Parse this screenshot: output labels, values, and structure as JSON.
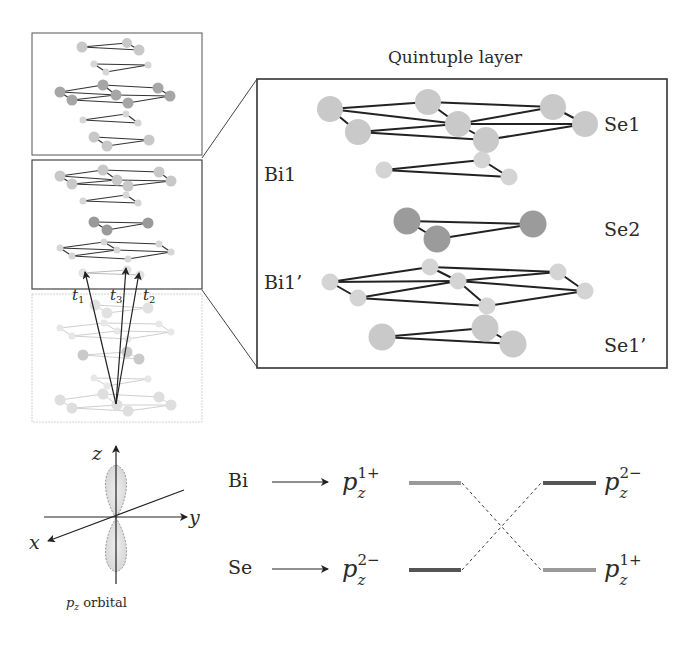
{
  "figure": {
    "title": "Quintuple layer",
    "layers": [
      {
        "id": "Se1",
        "label": "Se1",
        "element": "Se"
      },
      {
        "id": "Bi1",
        "label": "Bi1",
        "element": "Bi"
      },
      {
        "id": "Se2",
        "label": "Se2",
        "element": "Se"
      },
      {
        "id": "Bi1p",
        "label": "Bi1’",
        "element": "Bi"
      },
      {
        "id": "Se1p",
        "label": "Se1’",
        "element": "Se"
      }
    ],
    "hopping": {
      "t1": {
        "base": "t",
        "sub": "1"
      },
      "t3": {
        "base": "t",
        "sub": "3"
      },
      "t2": {
        "base": "t",
        "sub": "2"
      }
    },
    "orbital": {
      "axes": {
        "x": "x",
        "y": "y",
        "z": "z"
      },
      "caption_base": "p",
      "caption_sub": "z",
      "caption_rest": " orbital"
    },
    "energy_levels": {
      "left": [
        {
          "source": "Bi",
          "base": "p",
          "sub": "z",
          "sup": "1+",
          "color": "#9a9a9a"
        },
        {
          "source": "Se",
          "base": "p",
          "sub": "z",
          "sup": "2−",
          "color": "#555555"
        }
      ],
      "right": [
        {
          "base": "p",
          "sub": "z",
          "sup": "2−",
          "color": "#555555"
        },
        {
          "base": "p",
          "sub": "z",
          "sup": "1+",
          "color": "#9a9a9a"
        }
      ]
    },
    "colors": {
      "se_atom": "#c8c8c8",
      "se2_atom": "#9a9a9a",
      "bi_atom": "#d2d2d2",
      "bond": "#222222",
      "frame": "#333333",
      "faded_frame": "#b8b8b8"
    }
  }
}
